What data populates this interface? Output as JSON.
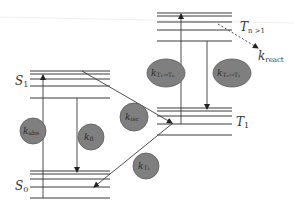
{
  "diagram": {
    "states": {
      "S1": {
        "label": "S",
        "sub": "1"
      },
      "S0": {
        "label": "S",
        "sub": "0"
      },
      "T1": {
        "label": "T",
        "sub": "1"
      },
      "Tn": {
        "label": "T",
        "sub": "n >1"
      }
    },
    "rates": {
      "abs": {
        "k": "k",
        "sub": "abs"
      },
      "fl": {
        "k": "k",
        "sub": "fl"
      },
      "isc": {
        "k": "k",
        "sub": "isc"
      },
      "T1": {
        "k": "k",
        "sub": "T₁"
      },
      "T1Tn": {
        "k": "k",
        "sub": "T₁→Tₙ"
      },
      "TnT1": {
        "k": "k",
        "sub": "Tₙ→T₁"
      },
      "react": {
        "k": "k",
        "sub": "react"
      }
    },
    "colors": {
      "ellipse_fill": "#7f7f7f",
      "line": "#3a3a3a",
      "background": "#ffffff"
    }
  }
}
